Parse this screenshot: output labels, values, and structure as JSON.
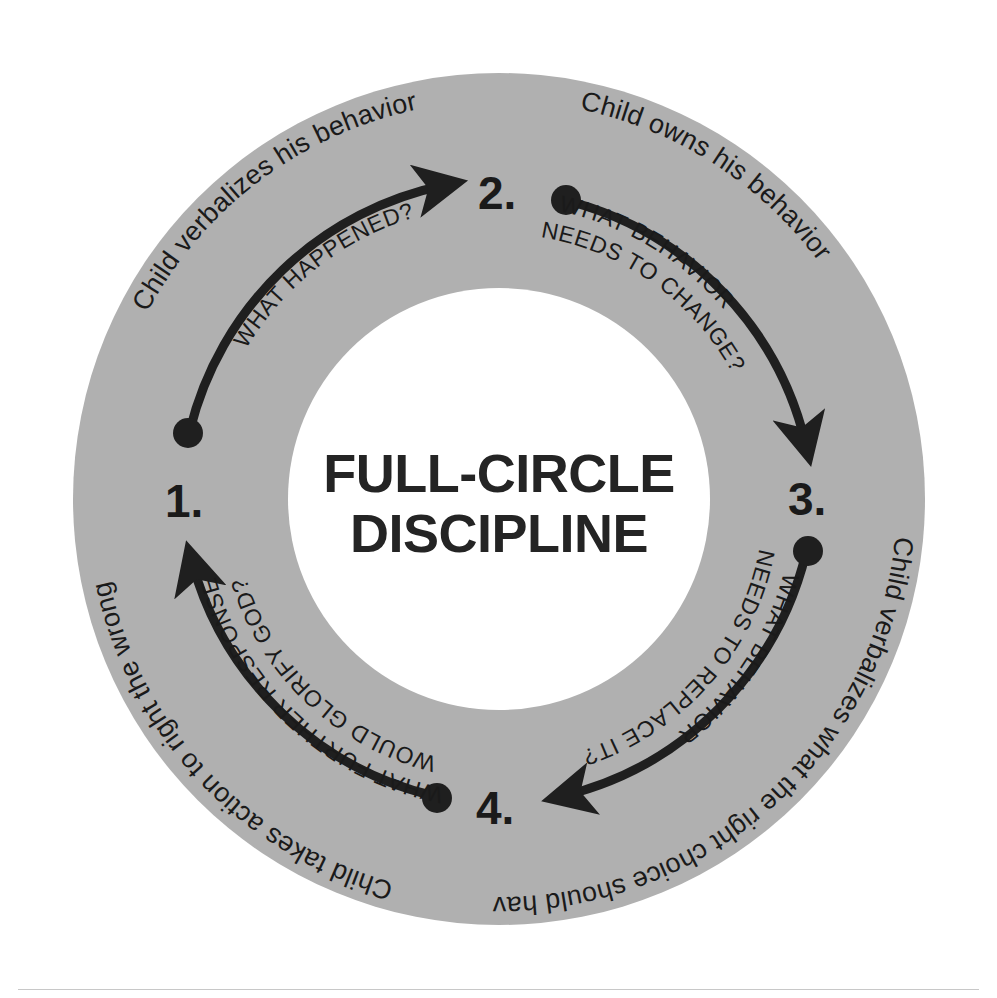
{
  "diagram": {
    "title_line1": "FULL-CIRCLE",
    "title_line2": "DISCIPLINE",
    "ring_color": "#b0b0b0",
    "ink_color": "#1f1f1f",
    "background_color": "#ffffff",
    "center": {
      "x": 499,
      "y": 499
    },
    "outer_radius": 426,
    "inner_radius": 211,
    "steps": [
      {
        "number": "1.",
        "outer_label": "Child verbalizes his behavior",
        "inner_label_line1": "WHAT HAPPENED?",
        "inner_label_line2": "",
        "arrow_from_deg": 202,
        "arrow_to_deg": 284
      },
      {
        "number": "2.",
        "outer_label": "Child owns his behavior",
        "inner_label_line1": "WHAT BEHAVIOR",
        "inner_label_line2": "NEEDS TO CHANGE?",
        "arrow_from_deg": 293,
        "arrow_to_deg": 372
      },
      {
        "number": "3.",
        "outer_label": "Child verbalizes what the right choice should have been",
        "inner_label_line1": "WHAT BEHAVIOR",
        "inner_label_line2": "NEEDS TO REPLACE IT?",
        "arrow_from_deg": 23,
        "arrow_to_deg": 104
      },
      {
        "number": "4.",
        "outer_label": "Child takes action to right the wrong",
        "inner_label_line1": "WHAT FURTHER RESPONSE",
        "inner_label_line2": "WOULD GLORIFY GOD?",
        "arrow_from_deg": 113,
        "arrow_to_deg": 192
      }
    ]
  }
}
